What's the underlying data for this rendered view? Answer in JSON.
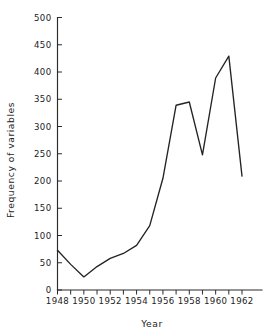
{
  "chart_data": {
    "type": "line",
    "title": "",
    "subtitle": "",
    "xlabel": "Year",
    "ylabel": "Frequency of variables",
    "xlim": [
      1948,
      1962
    ],
    "ylim": [
      0,
      500
    ],
    "grid": false,
    "legend": null,
    "x": [
      1948,
      1949,
      1950,
      1951,
      1952,
      1953,
      1954,
      1955,
      1956,
      1957,
      1958,
      1959,
      1960,
      1961,
      1962
    ],
    "series": [
      {
        "name": "Frequency of variables",
        "color": "#232323",
        "values": [
          73,
          47,
          24,
          43,
          58,
          67,
          82,
          118,
          205,
          339,
          345,
          248,
          389,
          429,
          209
        ]
      }
    ],
    "y_ticks": [
      0,
      50,
      100,
      150,
      200,
      250,
      300,
      350,
      400,
      450,
      500
    ],
    "y_tick_labels": [
      "0",
      "50",
      "100",
      "150",
      "200",
      "250",
      "300",
      "350",
      "400",
      "450",
      "500"
    ],
    "x_ticks": [
      1948,
      1949,
      1950,
      1951,
      1952,
      1953,
      1954,
      1955,
      1956,
      1957,
      1958,
      1959,
      1960,
      1961,
      1962
    ],
    "x_tick_labels": [
      "1948",
      "",
      "1950",
      "",
      "1952",
      "",
      "1954",
      "",
      "1956",
      "",
      "1958",
      "",
      "1960",
      "",
      "1962"
    ],
    "x_labeled_ticks": [
      {
        "value": 1948,
        "label": "1948"
      },
      {
        "value": 1950,
        "label": "1950"
      },
      {
        "value": 1952,
        "label": "1952"
      },
      {
        "value": 1954,
        "label": "1954"
      },
      {
        "value": 1956,
        "label": "1956"
      },
      {
        "value": 1958,
        "label": "1958"
      },
      {
        "value": 1960,
        "label": "1960"
      },
      {
        "value": 1962,
        "label": "1962"
      }
    ],
    "colors": {
      "background": "#ffffff",
      "axis": "#2b2b2b",
      "line": "#232323",
      "text": "#222222"
    }
  }
}
